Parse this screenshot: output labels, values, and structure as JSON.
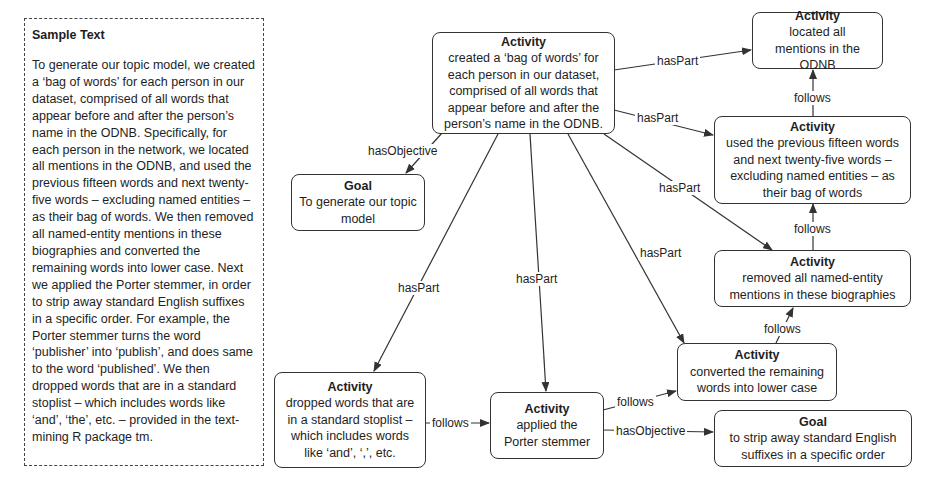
{
  "sample_text": {
    "title": "Sample Text",
    "body": "To generate our topic model, we created a ‘bag of words’ for each person in our dataset, comprised of all words that appear before and after the person’s name in the ODNB. Specifically, for each person in the network, we located all mentions in the ODNB, and used the previous fifteen words and next twenty-five words – excluding named entities – as their bag of words. We then removed all named-entity mentions in these biographies and converted the remaining words into lower case. Next we applied the Porter stemmer, in order to strip away standard English suffixes in a specific order. For example, the Porter stemmer turns the word ‘publisher’ into ‘publish’, and does same to the word ‘published’. We then dropped words that are in a standard stoplist – which includes words like ‘and’, ‘the’, etc. – provided in the text-mining R package tm."
  },
  "nodes": {
    "main": {
      "kind": "Activity",
      "text": "created a ‘bag of words’ for each person in our dataset, comprised of all words that appear before and after the person’s name in the ODNB."
    },
    "goal_topic": {
      "kind": "Goal",
      "text": "To generate our topic model"
    },
    "located": {
      "kind": "Activity",
      "text": "located all mentions in the ODNB"
    },
    "used_previous": {
      "kind": "Activity",
      "text": "used the previous fifteen words and next twenty-five words – excluding named entities – as their bag of words"
    },
    "removed": {
      "kind": "Activity",
      "text": "removed all named-entity mentions in these biographies"
    },
    "converted": {
      "kind": "Activity",
      "text": "converted the remaining words into lower case"
    },
    "goal_strip": {
      "kind": "Goal",
      "text": "to strip away standard English suffixes in a specific order"
    },
    "dropped": {
      "kind": "Activity",
      "text": "dropped words that are in a standard stoplist – which includes words like ‘and’, ‘,’, etc."
    },
    "porter": {
      "kind": "Activity",
      "text": "applied the Porter stemmer"
    }
  },
  "edge_labels": {
    "has_objective_main": "hasObjective",
    "has_part_located": "hasPart",
    "has_part_used": "hasPart",
    "has_part_removed": "hasPart",
    "has_part_converted": "hasPart",
    "has_part_porter": "hasPart",
    "has_part_dropped": "hasPart",
    "follows_used_located": "follows",
    "follows_removed_used": "follows",
    "follows_converted_removed": "follows",
    "follows_porter_converted": "follows",
    "has_objective_porter": "hasObjective",
    "follows_dropped_porter": "follows"
  },
  "colors": {
    "line": "#333333",
    "background": "#ffffff",
    "text": "#1e1e1e"
  }
}
